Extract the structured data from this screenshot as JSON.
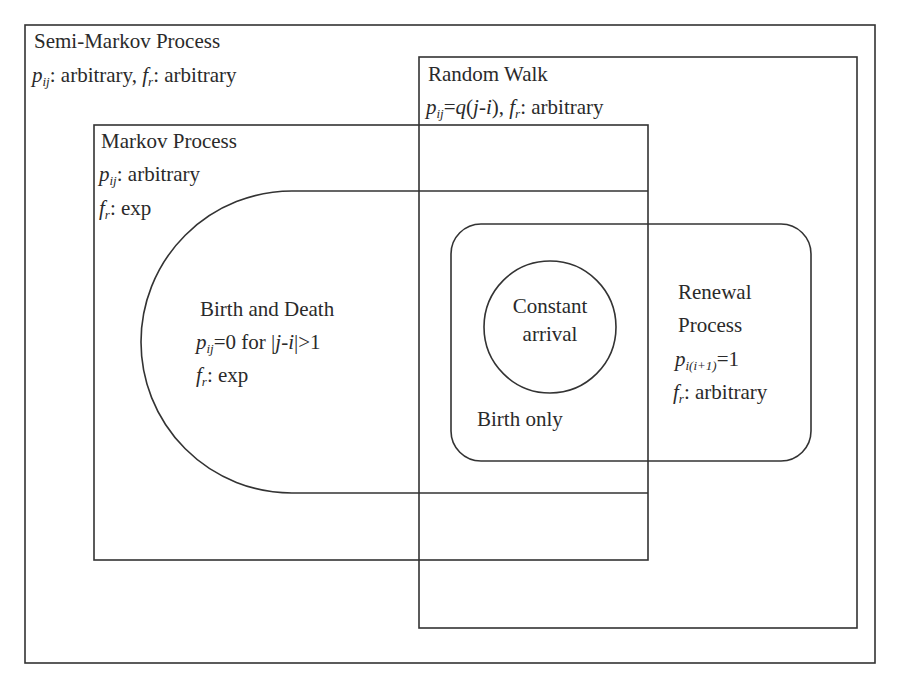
{
  "diagram": {
    "type": "venn",
    "stroke_color": "#333333",
    "background": "#ffffff",
    "sets": [
      {
        "id": "semi-markov",
        "title": "Semi-Markov Process",
        "p_sym": "p",
        "p_sub": "ij",
        "p_text": ": arbitrary,",
        "f_sym": "f",
        "f_sub": "r",
        "f_text": ": arbitrary",
        "shape": "rect"
      },
      {
        "id": "random-walk",
        "title": "Random Walk",
        "p_sym": "p",
        "p_sub": "ij",
        "p_eq": "=",
        "p_q": "q",
        "p_paren_open": "(",
        "p_j": "j",
        "p_minus": "-",
        "p_i": "i",
        "p_paren_close": "),",
        "f_sym": "f",
        "f_sub": "r",
        "f_text": ": arbitrary",
        "shape": "rect"
      },
      {
        "id": "markov",
        "title": "Markov Process",
        "p_sym": "p",
        "p_sub": "ij",
        "p_text": ": arbitrary",
        "f_sym": "f",
        "f_sub": "r",
        "f_text": ": exp",
        "shape": "rect"
      },
      {
        "id": "birth-death",
        "title": "Birth and Death",
        "p_sym": "p",
        "p_sub": "ij",
        "p_text": "=0 for |",
        "p_j": "j",
        "p_minus": "-",
        "p_i": "i",
        "p_tail": "|>1",
        "f_sym": "f",
        "f_sub": "r",
        "f_text": ": exp",
        "shape": "half-stadium"
      },
      {
        "id": "renewal",
        "title_line1": "Renewal",
        "title_line2": "Process",
        "p_sym": "p",
        "p_sub": "i(i+1)",
        "p_text": "=1",
        "f_sym": "f",
        "f_sub": "r",
        "f_text": ": arbitrary",
        "shape": "rounded-rect"
      },
      {
        "id": "birth-only",
        "title": "Birth only",
        "shape": "intersection"
      },
      {
        "id": "constant-arrival",
        "title_line1": "Constant",
        "title_line2": "arrival",
        "shape": "circle"
      }
    ]
  }
}
